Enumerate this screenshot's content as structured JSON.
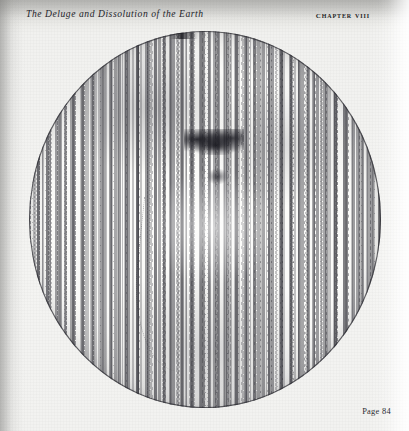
{
  "page": {
    "running_head_title": "The Deluge and Dissolution of the Earth",
    "chapter_label": "Chapter VIII",
    "folio": "Page 84",
    "paper_color": "#f3f3f1",
    "ink_color": "#24242a"
  },
  "plate": {
    "caption": "",
    "subject": "earth-globe-covered-by-water",
    "shape": "circle",
    "rendering": "engraved-wave-hatching"
  }
}
